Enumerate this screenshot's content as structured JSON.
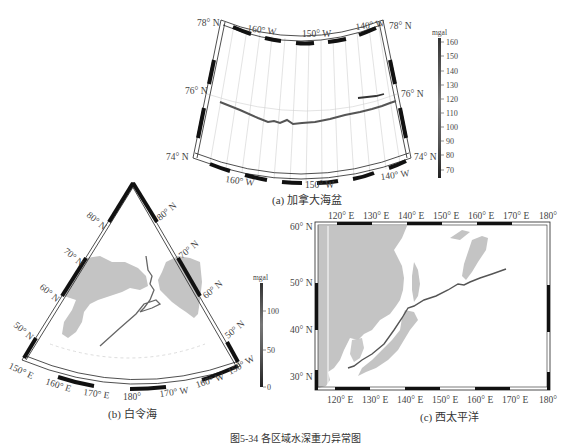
{
  "figure": {
    "caption": "图5-34 各区域水深重力异常图",
    "panels": [
      {
        "id": "a",
        "label": "(a) 加拿大海盆",
        "top_lon_labels": [
          "160° W",
          "150° W",
          "140° W"
        ],
        "bottom_lon_labels": [
          "160° W",
          "150° W",
          "140° W"
        ],
        "left_lat_labels": [
          "78° N",
          "76° N",
          "74° N"
        ],
        "right_lat_labels": [
          "78° N",
          "76° N",
          "74° N"
        ],
        "colorbar": {
          "unit": "mgal",
          "ticks": [
            "160",
            "150",
            "140",
            "130",
            "120",
            "110",
            "100",
            "90",
            "80",
            "70"
          ]
        }
      },
      {
        "id": "b",
        "label": "(b) 白令海",
        "left_lat_labels": [
          "80° N",
          "70° N",
          "60° N",
          "50° N"
        ],
        "right_lat_labels": [
          "80° N",
          "70° N",
          "60° N",
          "50° N"
        ],
        "bottom_lon_labels": [
          "150° E",
          "160° E",
          "170° E",
          "180°",
          "170° W",
          "160° W",
          "150° W"
        ],
        "colorbar": {
          "unit": "mgal",
          "ticks": [
            "100",
            "50",
            "0"
          ]
        }
      },
      {
        "id": "c",
        "label": "(c) 西太平洋",
        "top_lon_labels": [
          "120° E",
          "130° E",
          "140° E",
          "150° E",
          "160° E",
          "170° E",
          "180°"
        ],
        "bottom_lon_labels": [
          "120° E",
          "130° E",
          "140° E",
          "150° E",
          "160° E",
          "170° E",
          "180°"
        ],
        "left_lat_labels": [
          "60° N",
          "50° N",
          "40° N",
          "30° N"
        ]
      }
    ]
  },
  "colors": {
    "land": "#c4c4c4",
    "frame": "#111111",
    "grid": "#cfcfcf",
    "track": "#555555"
  }
}
